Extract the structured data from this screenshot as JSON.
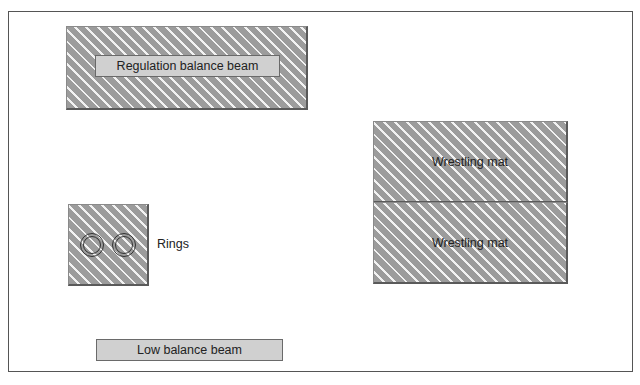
{
  "diagram": {
    "regulation_beam": {
      "label": "Regulation balance beam"
    },
    "rings": {
      "label": "Rings",
      "count": 2
    },
    "wrestling_mats": [
      {
        "label": "Wrestling mat"
      },
      {
        "label": "Wrestling mat"
      }
    ],
    "low_beam": {
      "label": "Low balance beam"
    },
    "colors": {
      "hatch_fill": "#9c9c9c",
      "hatch_stripe": "#f2f2f2",
      "label_fill": "#d0d0d0",
      "border": "#555555"
    }
  }
}
